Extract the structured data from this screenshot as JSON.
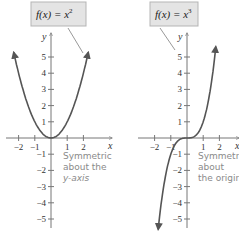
{
  "chart_data": [
    {
      "type": "line",
      "title": "f(x) = x^2",
      "label_main": "f(x) = x",
      "label_exp": "2",
      "function": "x^2",
      "xlabel": "x",
      "ylabel": "y",
      "xlim": [
        -2.8,
        2.8
      ],
      "ylim": [
        -6,
        6
      ],
      "x_ticks": [
        -2,
        -1,
        1,
        2
      ],
      "y_ticks": [
        1,
        2,
        3,
        4,
        5,
        -1,
        -2,
        -3,
        -4,
        -5
      ],
      "annotation": [
        "Symmetric",
        "about the",
        "y-axis"
      ],
      "x": [
        -2.3,
        -2,
        -1.5,
        -1,
        -0.5,
        0,
        0.5,
        1,
        1.5,
        2,
        2.3
      ],
      "y": [
        5.29,
        4,
        2.25,
        1,
        0.25,
        0,
        0.25,
        1,
        2.25,
        4,
        5.29
      ]
    },
    {
      "type": "line",
      "title": "f(x) = x^3",
      "label_main": "f(x) = x",
      "label_exp": "3",
      "function": "x^3",
      "xlabel": "x",
      "ylabel": "y",
      "xlim": [
        -2.8,
        2.8
      ],
      "ylim": [
        -6,
        6
      ],
      "x_ticks": [
        -2,
        -1,
        1,
        2
      ],
      "y_ticks": [
        1,
        2,
        3,
        4,
        5,
        -1,
        -2,
        -3,
        -4,
        -5
      ],
      "annotation": [
        "Symmetric",
        "about",
        "the origin"
      ],
      "x": [
        -1.78,
        -1.5,
        -1,
        -0.5,
        0,
        0.5,
        1,
        1.5,
        1.78
      ],
      "y": [
        -5.64,
        -3.375,
        -1,
        -0.125,
        0,
        0.125,
        1,
        3.375,
        5.64
      ]
    }
  ],
  "colors": {
    "curve": "#555555",
    "axis": "#777777",
    "callout_bg": "#e4e4e4",
    "callout_border": "#b5b5b5"
  }
}
